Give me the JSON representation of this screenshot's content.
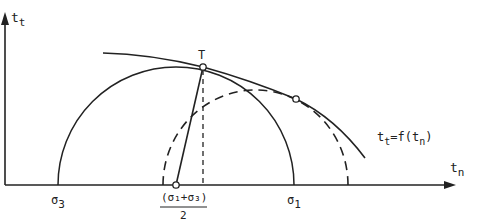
{
  "diagram": {
    "axes": {
      "x_label": "t",
      "x_sub": "n",
      "y_label": "t",
      "y_sub": "t"
    },
    "points": {
      "tangent_point": "T",
      "sigma3": "σ",
      "sigma3_sub": "3",
      "sigma1": "σ",
      "sigma1_sub": "1",
      "center_numerator": "(σ₁+σ₃)",
      "center_denominator": "2"
    },
    "envelope_label": {
      "t": "t",
      "t_sub": "t",
      "eq": "=f(t",
      "n_sub": "n",
      "close": ")"
    },
    "colors": {
      "stroke": "#222222",
      "background": "#ffffff"
    }
  }
}
